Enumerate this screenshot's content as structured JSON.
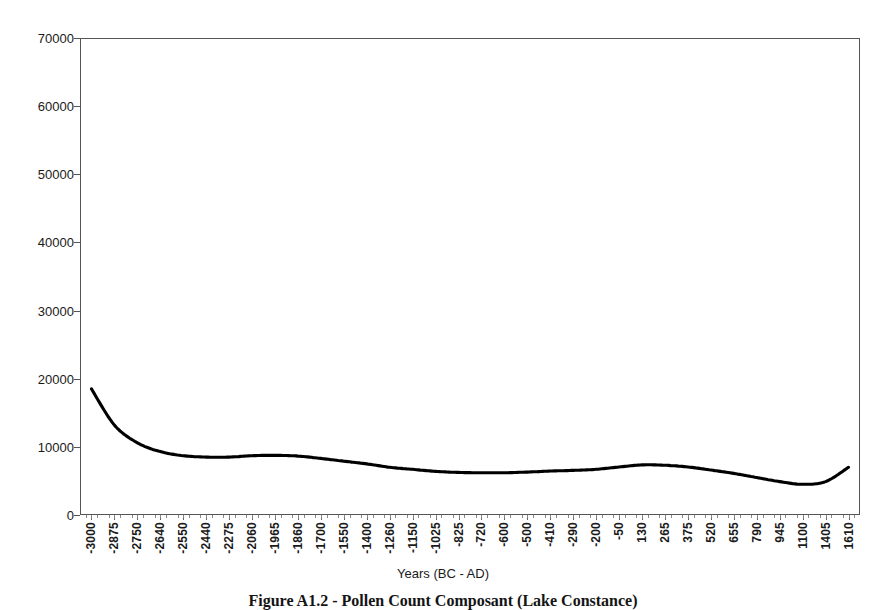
{
  "figure": {
    "caption": "Figure A1.2 - Pollen Count Composant (Lake Constance)"
  },
  "chart_data": {
    "type": "line",
    "title": "",
    "xlabel": "Years (BC - AD)",
    "ylabel": "Arboreal Pollen Count",
    "ylim": [
      0,
      70000
    ],
    "y_ticks": [
      0,
      10000,
      20000,
      30000,
      40000,
      50000,
      60000,
      70000
    ],
    "grid": false,
    "legend": "none",
    "line_color": "#000000",
    "categories": [
      "-3000",
      "-2875",
      "-2750",
      "-2640",
      "-2550",
      "-2440",
      "-2275",
      "-2060",
      "-1965",
      "-1860",
      "-1700",
      "-1550",
      "-1400",
      "-1260",
      "-1150",
      "-1025",
      "-825",
      "-720",
      "-600",
      "-500",
      "-410",
      "-290",
      "-200",
      "-50",
      "130",
      "265",
      "375",
      "520",
      "655",
      "790",
      "945",
      "1100",
      "1405",
      "1610"
    ],
    "values": [
      18500,
      13200,
      10600,
      9300,
      8700,
      8500,
      8500,
      8700,
      8750,
      8650,
      8300,
      7900,
      7500,
      7000,
      6700,
      6400,
      6250,
      6200,
      6200,
      6300,
      6450,
      6550,
      6700,
      7050,
      7350,
      7300,
      7050,
      6600,
      6100,
      5500,
      4900,
      4500,
      4900,
      7000
    ]
  }
}
